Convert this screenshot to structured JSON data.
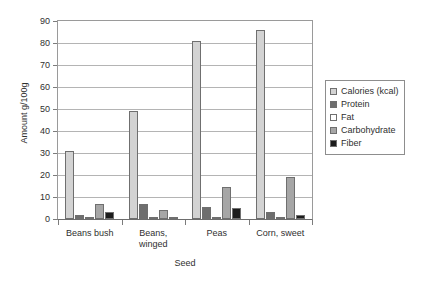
{
  "chart_data": {
    "type": "bar",
    "title": "",
    "xlabel": "Seed",
    "ylabel": "Amount g/100g",
    "categories": [
      "Beans bush",
      "Beans, winged",
      "Peas",
      "Corn, sweet"
    ],
    "category_lines": [
      [
        "Beans bush"
      ],
      [
        "Beans,",
        "winged"
      ],
      [
        "Peas"
      ],
      [
        "Corn, sweet"
      ]
    ],
    "series": [
      {
        "name": "Calories (kcal)",
        "color": "#d3d3d3",
        "values": [
          31,
          49,
          81,
          86
        ]
      },
      {
        "name": "Protein",
        "color": "#6e6e6e",
        "values": [
          1.8,
          6.9,
          5.4,
          3.2
        ]
      },
      {
        "name": "Fat",
        "color": "#ffffff",
        "values": [
          0.2,
          0.2,
          0.4,
          0.5
        ]
      },
      {
        "name": "Carbohydrate",
        "color": "#a6a6a6",
        "values": [
          7.0,
          4.3,
          14.5,
          19.0
        ]
      },
      {
        "name": "Fiber",
        "color": "#1c1c1c",
        "values": [
          3.4,
          0.2,
          5.1,
          2.0
        ]
      }
    ],
    "ylim": [
      0,
      90
    ],
    "yticks": [
      0,
      10,
      20,
      30,
      40,
      50,
      60,
      70,
      80,
      90
    ],
    "ytick_labels": [
      "0",
      "10",
      "20",
      "30",
      "40",
      "50",
      "60",
      "70",
      "80",
      "90"
    ],
    "grid": true,
    "legend_position": "right"
  }
}
